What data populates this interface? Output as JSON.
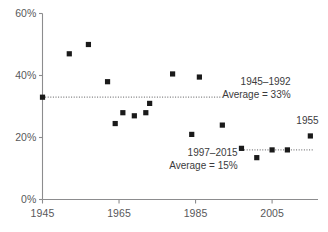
{
  "chart_data": {
    "type": "scatter",
    "title": "",
    "xlabel": "",
    "ylabel": "",
    "xlim": [
      1945,
      2017
    ],
    "ylim": [
      0,
      60
    ],
    "xticks": [
      1945,
      1965,
      1985,
      2005
    ],
    "xtick_labels": [
      "1945",
      "1965",
      "1985",
      "2005"
    ],
    "yticks": [
      0,
      20,
      40,
      60
    ],
    "ytick_labels": [
      "0%",
      "20%",
      "40%",
      "60%"
    ],
    "grid": false,
    "legend": null,
    "marker": "square",
    "marker_color": "#1a1a1a",
    "series": [
      {
        "name": "Observations",
        "x": [
          1945,
          1952,
          1957,
          1962,
          1964,
          1966,
          1969,
          1972,
          1973,
          1979,
          1984,
          1986,
          1992,
          1997,
          2001,
          2005,
          2009,
          2015
        ],
        "y": [
          33,
          47,
          50,
          38,
          24.5,
          28,
          27,
          28,
          31,
          40.5,
          21,
          39.5,
          24,
          16.5,
          13.5,
          16,
          16,
          20.5
        ]
      }
    ],
    "trend_lines": [
      {
        "name": "1945-1992 average",
        "x_start": 1945,
        "x_end": 1992,
        "value": 33,
        "style": "dotted",
        "color": "#7a7a7c"
      },
      {
        "name": "1997-2015 average",
        "x_start": 1997,
        "x_end": 2016,
        "value": 16,
        "style": "dotted",
        "color": "#7a7a7c"
      }
    ],
    "annotations": [
      {
        "name": "upper-average-annotation",
        "line1": "1945–1992",
        "line2": "Average = 33%",
        "x": 1993,
        "y": 36
      },
      {
        "name": "lower-average-annotation",
        "line1": "1997–2015",
        "line2": "Average = 15%",
        "x": 1996,
        "y": 13
      },
      {
        "name": "point-year-label",
        "line1": "1955",
        "line2": "",
        "x": 2015,
        "y": 25
      }
    ],
    "axis_color": "#8c8c8e",
    "text_color": "#58585a"
  },
  "axes": {
    "y_ticks": [
      "0%",
      "20%",
      "40%",
      "60%"
    ],
    "x_ticks": [
      "1945",
      "1965",
      "1985",
      "2005"
    ]
  },
  "annotations": {
    "upper": {
      "range": "1945–1992",
      "average": "Average = 33%"
    },
    "lower": {
      "range": "1997–2015",
      "average": "Average = 15%"
    },
    "point_label": "1955"
  }
}
